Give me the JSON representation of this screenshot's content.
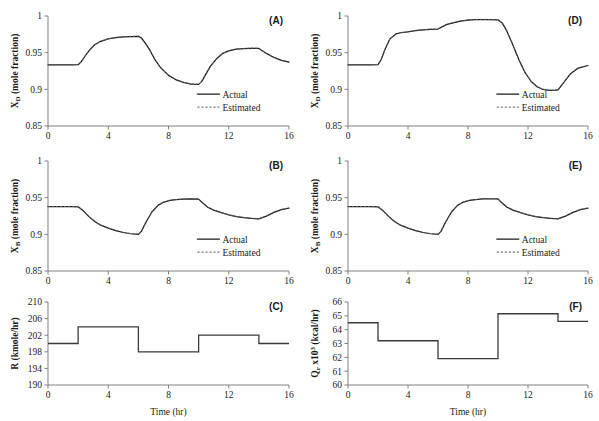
{
  "figure": {
    "title": "",
    "panel_count": 6,
    "x_axis_label": "Time (hr)",
    "legend": {
      "actual_label": "Actual",
      "estimated_label": "Estimated"
    },
    "colors": {
      "actual": "#1a1a1a",
      "estimated": "#5a5a5a",
      "step": "#3a3a3a",
      "axis": "#808080",
      "background": "#ffffff"
    }
  },
  "chart_data": [
    {
      "type": "line",
      "panel": "(A)",
      "title": "",
      "xlabel": "",
      "ylabel": "X_D (mole fraction)",
      "ylabel_base": "X",
      "ylabel_sub": "D",
      "ylabel_rest": " (mole fraction)",
      "xlim": [
        0,
        16
      ],
      "ylim": [
        0.85,
        1
      ],
      "xticks": [
        0,
        4,
        8,
        12,
        16
      ],
      "yticks": [
        0.85,
        0.9,
        0.95,
        1
      ],
      "ytick_labels": [
        "0.85",
        "0.9",
        "0.95",
        "1"
      ],
      "xtick_labels": [
        "0",
        "4",
        "8",
        "12",
        "16"
      ],
      "grid": false,
      "legend_position": "bottom-right",
      "series": [
        {
          "name": "Actual",
          "style": "solid",
          "x": [
            0,
            0.5,
            1,
            1.5,
            2,
            2.2,
            2.5,
            2.8,
            3.1,
            3.5,
            4,
            4.5,
            5,
            5.5,
            6,
            6.2,
            6.5,
            6.8,
            7.1,
            7.5,
            8,
            8.5,
            9,
            9.5,
            10,
            10.2,
            10.5,
            10.8,
            11.2,
            11.6,
            12,
            12.5,
            13,
            13.5,
            14,
            14.5,
            15,
            15.5,
            16
          ],
          "y": [
            0.9335,
            0.9335,
            0.9335,
            0.9335,
            0.9336,
            0.9375,
            0.9465,
            0.9545,
            0.9608,
            0.9655,
            0.9688,
            0.9705,
            0.9715,
            0.972,
            0.9722,
            0.97,
            0.962,
            0.952,
            0.9405,
            0.929,
            0.919,
            0.913,
            0.9095,
            0.9072,
            0.9068,
            0.9105,
            0.9215,
            0.932,
            0.942,
            0.949,
            0.9525,
            0.9548,
            0.9556,
            0.956,
            0.9558,
            0.949,
            0.9435,
            0.9395,
            0.9372
          ]
        },
        {
          "name": "Estimated",
          "style": "dashed",
          "x": [
            0,
            0.5,
            1,
            1.5,
            2,
            2.2,
            2.5,
            2.8,
            3.1,
            3.5,
            4,
            4.5,
            5,
            5.5,
            6,
            6.2,
            6.5,
            6.8,
            7.1,
            7.5,
            8,
            8.5,
            9,
            9.5,
            10,
            10.2,
            10.5,
            10.8,
            11.2,
            11.6,
            12,
            12.5,
            13,
            13.5,
            14,
            14.5,
            15,
            15.5,
            16
          ],
          "y": [
            0.9337,
            0.9336,
            0.9337,
            0.9336,
            0.9338,
            0.9378,
            0.9468,
            0.9547,
            0.961,
            0.9657,
            0.969,
            0.9707,
            0.9717,
            0.9722,
            0.9724,
            0.9702,
            0.9622,
            0.9522,
            0.9407,
            0.9292,
            0.9192,
            0.9132,
            0.9097,
            0.9074,
            0.907,
            0.9107,
            0.9217,
            0.9322,
            0.9422,
            0.9492,
            0.9527,
            0.955,
            0.9558,
            0.9562,
            0.956,
            0.9492,
            0.9437,
            0.9397,
            0.9374
          ]
        }
      ]
    },
    {
      "type": "line",
      "panel": "(D)",
      "title": "",
      "xlabel": "",
      "ylabel": "X_D (mole fraction)",
      "ylabel_base": "X",
      "ylabel_sub": "D",
      "ylabel_rest": " (mole fraction)",
      "xlim": [
        0,
        16
      ],
      "ylim": [
        0.85,
        1
      ],
      "xticks": [
        0,
        4,
        8,
        12,
        16
      ],
      "yticks": [
        0.85,
        0.9,
        0.95,
        1
      ],
      "ytick_labels": [
        "0.85",
        "0.9",
        "0.95",
        "1"
      ],
      "xtick_labels": [
        "0",
        "4",
        "8",
        "12",
        "16"
      ],
      "grid": false,
      "legend_position": "bottom-right",
      "series": [
        {
          "name": "Actual",
          "style": "solid",
          "x": [
            0,
            0.5,
            1,
            1.5,
            2,
            2.2,
            2.5,
            2.8,
            3.2,
            3.6,
            4,
            4.5,
            5,
            5.5,
            6,
            6.3,
            6.6,
            7,
            7.5,
            8,
            8.5,
            9,
            9.5,
            10,
            10.3,
            10.6,
            11,
            11.4,
            11.8,
            12.2,
            12.6,
            13,
            13.4,
            13.8,
            14,
            14.3,
            14.8,
            15.3,
            16
          ],
          "y": [
            0.9335,
            0.9335,
            0.9335,
            0.9335,
            0.9336,
            0.94,
            0.956,
            0.969,
            0.9755,
            0.9775,
            0.9785,
            0.98,
            0.9812,
            0.9818,
            0.9822,
            0.9855,
            0.9885,
            0.9905,
            0.993,
            0.9945,
            0.995,
            0.9952,
            0.995,
            0.9948,
            0.99,
            0.979,
            0.96,
            0.94,
            0.923,
            0.911,
            0.9035,
            0.8998,
            0.8985,
            0.8988,
            0.8992,
            0.907,
            0.9205,
            0.9285,
            0.9325
          ]
        },
        {
          "name": "Estimated",
          "style": "dashed",
          "x": [
            0,
            0.5,
            1,
            1.5,
            2,
            2.2,
            2.5,
            2.8,
            3.2,
            3.6,
            4,
            4.5,
            5,
            5.5,
            6,
            6.3,
            6.6,
            7,
            7.5,
            8,
            8.5,
            9,
            9.5,
            10,
            10.3,
            10.6,
            11,
            11.4,
            11.8,
            12.2,
            12.6,
            13,
            13.4,
            13.8,
            14,
            14.3,
            14.8,
            15.3,
            16
          ],
          "y": [
            0.9337,
            0.9337,
            0.9336,
            0.9337,
            0.9338,
            0.9403,
            0.9563,
            0.9692,
            0.9757,
            0.9777,
            0.9787,
            0.9802,
            0.9814,
            0.982,
            0.9824,
            0.9857,
            0.9887,
            0.9907,
            0.9932,
            0.9947,
            0.9952,
            0.9954,
            0.9952,
            0.995,
            0.9902,
            0.9792,
            0.9602,
            0.9402,
            0.9232,
            0.9112,
            0.9037,
            0.9,
            0.8987,
            0.899,
            0.8994,
            0.9072,
            0.9207,
            0.9287,
            0.9327
          ]
        }
      ]
    },
    {
      "type": "line",
      "panel": "(B)",
      "title": "",
      "xlabel": "",
      "ylabel": "X_B (mole fraction)",
      "ylabel_base": "X",
      "ylabel_sub": "B",
      "ylabel_rest": " (mole fraction)",
      "xlim": [
        0,
        16
      ],
      "ylim": [
        0.85,
        1
      ],
      "xticks": [
        0,
        4,
        8,
        12,
        16
      ],
      "yticks": [
        0.85,
        0.9,
        0.95,
        1
      ],
      "ytick_labels": [
        "0.85",
        "0.9",
        "0.95",
        "1"
      ],
      "xtick_labels": [
        "0",
        "4",
        "8",
        "12",
        "16"
      ],
      "grid": false,
      "legend_position": "bottom-right",
      "series": [
        {
          "name": "Actual",
          "style": "solid",
          "x": [
            0,
            0.5,
            1,
            1.5,
            2,
            2.3,
            2.7,
            3.1,
            3.5,
            4,
            4.5,
            5,
            5.5,
            6,
            6.2,
            6.5,
            6.9,
            7.3,
            7.7,
            8.1,
            8.5,
            9,
            9.5,
            10,
            10.2,
            10.6,
            11,
            11.5,
            12,
            12.5,
            13,
            13.5,
            14,
            14.5,
            15,
            15.5,
            16
          ],
          "y": [
            0.9378,
            0.9378,
            0.9377,
            0.9378,
            0.9376,
            0.933,
            0.9245,
            0.9175,
            0.9125,
            0.9085,
            0.905,
            0.9025,
            0.9008,
            0.9,
            0.904,
            0.9165,
            0.9305,
            0.9395,
            0.944,
            0.9462,
            0.9472,
            0.948,
            0.9483,
            0.948,
            0.944,
            0.937,
            0.933,
            0.9295,
            0.9265,
            0.9242,
            0.9228,
            0.9218,
            0.9212,
            0.9248,
            0.93,
            0.9338,
            0.9358
          ]
        },
        {
          "name": "Estimated",
          "style": "dashed",
          "x": [
            0,
            0.5,
            1,
            1.5,
            2,
            2.3,
            2.7,
            3.1,
            3.5,
            4,
            4.5,
            5,
            5.5,
            6,
            6.2,
            6.5,
            6.9,
            7.3,
            7.7,
            8.1,
            8.5,
            9,
            9.5,
            10,
            10.2,
            10.6,
            11,
            11.5,
            12,
            12.5,
            13,
            13.5,
            14,
            14.5,
            15,
            15.5,
            16
          ],
          "y": [
            0.938,
            0.9379,
            0.9379,
            0.938,
            0.9378,
            0.9332,
            0.9247,
            0.9177,
            0.9127,
            0.9087,
            0.9052,
            0.9027,
            0.901,
            0.9002,
            0.9042,
            0.9167,
            0.9307,
            0.9397,
            0.9442,
            0.9464,
            0.9474,
            0.9482,
            0.9485,
            0.9482,
            0.9442,
            0.9372,
            0.9332,
            0.9297,
            0.9267,
            0.9244,
            0.923,
            0.922,
            0.9214,
            0.925,
            0.9302,
            0.934,
            0.936
          ]
        }
      ]
    },
    {
      "type": "line",
      "panel": "(E)",
      "title": "",
      "xlabel": "",
      "ylabel": "X_B (mole fraction)",
      "ylabel_base": "X",
      "ylabel_sub": "B",
      "ylabel_rest": " (mole fraction)",
      "xlim": [
        0,
        16
      ],
      "ylim": [
        0.85,
        1
      ],
      "xticks": [
        0,
        4,
        8,
        12,
        16
      ],
      "yticks": [
        0.85,
        0.9,
        0.95,
        1
      ],
      "ytick_labels": [
        "0.85",
        "0.9",
        "0.95",
        "1"
      ],
      "xtick_labels": [
        "0",
        "4",
        "8",
        "12",
        "16"
      ],
      "grid": false,
      "legend_position": "bottom-right",
      "series": [
        {
          "name": "Actual",
          "style": "solid",
          "x": [
            0,
            0.5,
            1,
            1.5,
            2,
            2.3,
            2.7,
            3.1,
            3.5,
            4,
            4.5,
            5,
            5.5,
            6,
            6.2,
            6.5,
            6.9,
            7.3,
            7.7,
            8.1,
            8.5,
            9,
            9.5,
            10,
            10.2,
            10.6,
            11,
            11.5,
            12,
            12.5,
            13,
            13.5,
            14,
            14.5,
            15,
            15.5,
            16
          ],
          "y": [
            0.9378,
            0.9378,
            0.9377,
            0.9378,
            0.9376,
            0.933,
            0.9245,
            0.9175,
            0.9125,
            0.9085,
            0.905,
            0.9025,
            0.9008,
            0.9,
            0.904,
            0.9165,
            0.9305,
            0.9395,
            0.944,
            0.9462,
            0.9472,
            0.9482,
            0.9485,
            0.9482,
            0.944,
            0.937,
            0.933,
            0.9295,
            0.9265,
            0.9242,
            0.9228,
            0.9218,
            0.9212,
            0.9248,
            0.93,
            0.9338,
            0.9358
          ]
        },
        {
          "name": "Estimated",
          "style": "dashed",
          "x": [
            0,
            0.5,
            1,
            1.5,
            2,
            2.3,
            2.7,
            3.1,
            3.5,
            4,
            4.5,
            5,
            5.5,
            6,
            6.2,
            6.5,
            6.9,
            7.3,
            7.7,
            8.1,
            8.5,
            9,
            9.5,
            10,
            10.2,
            10.6,
            11,
            11.5,
            12,
            12.5,
            13,
            13.5,
            14,
            14.5,
            15,
            15.5,
            16
          ],
          "y": [
            0.938,
            0.9379,
            0.9379,
            0.938,
            0.9378,
            0.9332,
            0.9247,
            0.9177,
            0.9127,
            0.9087,
            0.9052,
            0.9027,
            0.901,
            0.9002,
            0.9042,
            0.9167,
            0.9307,
            0.9397,
            0.9442,
            0.9464,
            0.9474,
            0.9484,
            0.9487,
            0.9484,
            0.9442,
            0.9372,
            0.9332,
            0.9297,
            0.9267,
            0.9244,
            0.923,
            0.922,
            0.9214,
            0.925,
            0.9302,
            0.934,
            0.936
          ]
        }
      ]
    },
    {
      "type": "line",
      "panel": "(C)",
      "title": "",
      "xlabel": "Time (hr)",
      "ylabel": "R (kmole/hr)",
      "ylabel_base": "R (kmole/hr)",
      "ylabel_sub": "",
      "ylabel_rest": "",
      "xlim": [
        0,
        16
      ],
      "ylim": [
        190,
        210
      ],
      "xticks": [
        0,
        4,
        8,
        12,
        16
      ],
      "yticks": [
        190,
        194,
        198,
        202,
        206,
        210
      ],
      "ytick_labels": [
        "190",
        "194",
        "198",
        "202",
        "206",
        "210"
      ],
      "xtick_labels": [
        "0",
        "4",
        "8",
        "12",
        "16"
      ],
      "grid": false,
      "legend_position": "none",
      "step_segments": [
        {
          "x_start": 0,
          "x_end": 2,
          "value": 200
        },
        {
          "x_start": 2,
          "x_end": 6,
          "value": 204
        },
        {
          "x_start": 6,
          "x_end": 10,
          "value": 198
        },
        {
          "x_start": 10,
          "x_end": 14,
          "value": 202
        },
        {
          "x_start": 14,
          "x_end": 16,
          "value": 200
        }
      ]
    },
    {
      "type": "line",
      "panel": "(F)",
      "title": "",
      "xlabel": "Time (hr)",
      "ylabel": "Qr x10^3 (kcal/hr)",
      "ylabel_base": "Q",
      "ylabel_sub": "r",
      "ylabel_rest": " x10",
      "ylabel_sup": "3",
      "ylabel_tail": " (kcal/hr)",
      "xlim": [
        0,
        16
      ],
      "ylim": [
        60,
        66
      ],
      "xticks": [
        0,
        4,
        8,
        12,
        16
      ],
      "yticks": [
        60,
        61,
        62,
        63,
        64,
        65,
        66
      ],
      "ytick_labels": [
        "60",
        "61",
        "62",
        "63",
        "64",
        "65",
        "66"
      ],
      "xtick_labels": [
        "0",
        "4",
        "8",
        "12",
        "16"
      ],
      "grid": false,
      "legend_position": "none",
      "step_segments": [
        {
          "x_start": 0,
          "x_end": 2,
          "value": 64.5
        },
        {
          "x_start": 2,
          "x_end": 6,
          "value": 63.2
        },
        {
          "x_start": 6,
          "x_end": 10,
          "value": 61.9
        },
        {
          "x_start": 10,
          "x_end": 14,
          "value": 65.15
        },
        {
          "x_start": 14,
          "x_end": 16,
          "value": 64.6
        }
      ]
    }
  ]
}
